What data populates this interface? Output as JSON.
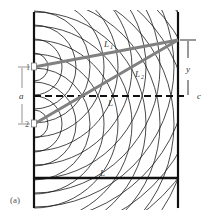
{
  "figure": {
    "panel_label": "(a)",
    "labels": {
      "slit1": "1",
      "slit2": "2",
      "slit_spacing": "a",
      "path1": "L",
      "path1_sub": "1",
      "path2": "L",
      "path2_sub": "2",
      "center_path": "L",
      "bottom_path": "L",
      "screen_offset": "y",
      "center_point": "c"
    },
    "colors": {
      "wavefront": "#1a1a1a",
      "ray": "#808080",
      "wall": "#111111",
      "background": "#ffffff"
    },
    "geometry": {
      "left_wall_x": 34,
      "right_wall_x": 178,
      "slit1_y": 67,
      "slit2_y": 124,
      "centerline_y": 96,
      "screen_point_y": 40,
      "bottom_line_y": 178
    }
  }
}
